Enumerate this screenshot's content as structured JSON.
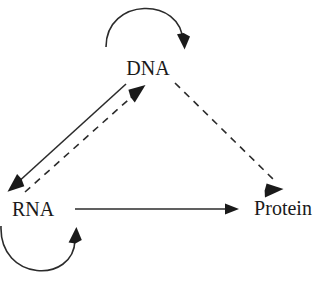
{
  "diagram": {
    "background_color": "#ffffff",
    "stroke_color": "#2b2b2b",
    "text_color": "#1a1a1a",
    "width": 315,
    "height": 288,
    "nodes": [
      {
        "id": "dna",
        "label": "DNA",
        "x": 148,
        "y": 70,
        "anchor": "middle"
      },
      {
        "id": "rna",
        "label": "RNA",
        "x": 33,
        "y": 211,
        "anchor": "middle"
      },
      {
        "id": "protein",
        "label": "Protein",
        "x": 283,
        "y": 210,
        "anchor": "middle"
      }
    ],
    "edges": [
      {
        "id": "dna-replication",
        "from": "DNA",
        "to": "DNA",
        "style": "solid",
        "shape": "self-loop-arc",
        "direction": "clockwise-above"
      },
      {
        "id": "dna-to-rna",
        "from": "DNA",
        "to": "RNA",
        "style": "solid",
        "shape": "straight",
        "direction": "down-left"
      },
      {
        "id": "rna-to-dna",
        "from": "RNA",
        "to": "DNA",
        "style": "dashed",
        "shape": "straight",
        "direction": "up-right"
      },
      {
        "id": "dna-to-protein",
        "from": "DNA",
        "to": "Protein",
        "style": "dashed",
        "shape": "straight",
        "direction": "down-right"
      },
      {
        "id": "rna-to-protein",
        "from": "RNA",
        "to": "Protein",
        "style": "solid",
        "shape": "straight",
        "direction": "right"
      },
      {
        "id": "rna-replication",
        "from": "RNA",
        "to": "RNA",
        "style": "solid",
        "shape": "self-loop-arc",
        "direction": "counterclockwise-below"
      }
    ]
  }
}
